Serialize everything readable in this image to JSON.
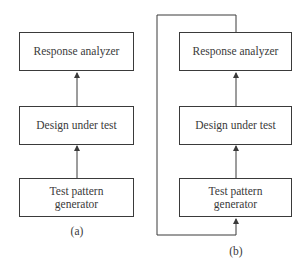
{
  "diagram_a": {
    "caption": "(a)",
    "blocks": {
      "top": "Response analyzer",
      "middle": "Design under test",
      "bottom_line1": "Test pattern",
      "bottom_line2": "generator"
    }
  },
  "diagram_b": {
    "caption": "(b)",
    "blocks": {
      "top": "Response analyzer",
      "middle": "Design under test",
      "bottom_line1": "Test pattern",
      "bottom_line2": "generator"
    },
    "feedback_loop": "Response analyzer output fed back to test pattern generator input"
  },
  "colors": {
    "line": "#3a3a3a",
    "background": "#ffffff"
  }
}
